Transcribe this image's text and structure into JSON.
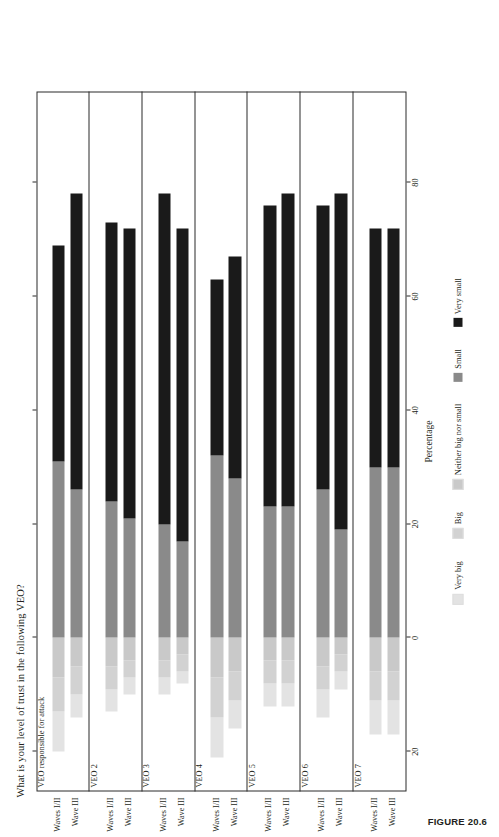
{
  "figure": {
    "caption": "FIGURE 20.6",
    "title": "What is your level of trust in the following VEO?"
  },
  "axis": {
    "label": "Percentage",
    "ticks": [
      -20,
      0,
      20,
      40,
      60,
      80
    ],
    "tick_labels": [
      "20",
      "0",
      "20",
      "40",
      "60",
      "80"
    ],
    "min": -27,
    "max": 96
  },
  "legend": {
    "items": [
      {
        "label": "Very big",
        "color": "#e3e3e3"
      },
      {
        "label": "Big",
        "color": "#d2d2d2"
      },
      {
        "label": "Neither big nor small",
        "color": "#c9c9c9"
      },
      {
        "label": "Small",
        "color": "#8a8a8a"
      },
      {
        "label": "Very small",
        "color": "#1a1a1a"
      }
    ]
  },
  "categories": [
    "Waves I/II",
    "Wave III"
  ],
  "chart_data": {
    "type": "bar",
    "subtype": "diverging-stacked-likert",
    "title": "What is your level of trust in the following VEO?",
    "xlabel": "Percentage",
    "ylabel": "",
    "xlim": [
      -27,
      96
    ],
    "grid": false,
    "legend_position": "bottom",
    "series": [
      {
        "name": "Very big",
        "color": "#e3e3e3"
      },
      {
        "name": "Big",
        "color": "#d2d2d2"
      },
      {
        "name": "Neither big nor small",
        "color": "#c9c9c9"
      },
      {
        "name": "Small",
        "color": "#8a8a8a"
      },
      {
        "name": "Very small",
        "color": "#1a1a1a"
      }
    ],
    "panels": [
      {
        "name": "VEO responsible for attack",
        "bars": [
          {
            "category": "Waves I/II",
            "start": -20.0,
            "values": {
              "Very big": 7.0,
              "Big": 6.0,
              "Neither big nor small": 7.0,
              "Small": 31.0,
              "Very small": 38.0
            },
            "total_end": 69.0
          },
          {
            "category": "Wave III",
            "start": -14.0,
            "values": {
              "Very big": 4.0,
              "Big": 5.0,
              "Neither big nor small": 5.0,
              "Small": 26.0,
              "Very small": 52.0
            },
            "total_end": 78.0
          }
        ]
      },
      {
        "name": "VEO 2",
        "bars": [
          {
            "category": "Waves I/II",
            "start": -13.0,
            "values": {
              "Very big": 4.0,
              "Big": 4.0,
              "Neither big nor small": 5.0,
              "Small": 24.0,
              "Very small": 49.0
            },
            "total_end": 73.0
          },
          {
            "category": "Wave III",
            "start": -10.0,
            "values": {
              "Very big": 3.0,
              "Big": 3.0,
              "Neither big nor small": 4.0,
              "Small": 21.0,
              "Very small": 51.0
            },
            "total_end": 72.0
          }
        ]
      },
      {
        "name": "VEO 3",
        "bars": [
          {
            "category": "Waves I/II",
            "start": -10.0,
            "values": {
              "Very big": 3.0,
              "Big": 3.0,
              "Neither big nor small": 4.0,
              "Small": 20.0,
              "Very small": 58.0
            },
            "total_end": 78.0
          },
          {
            "category": "Wave III",
            "start": -8.0,
            "values": {
              "Very big": 2.0,
              "Big": 3.0,
              "Neither big nor small": 3.0,
              "Small": 17.0,
              "Very small": 55.0
            },
            "total_end": 72.0
          }
        ]
      },
      {
        "name": "VEO 4",
        "bars": [
          {
            "category": "Waves I/II",
            "start": -21.0,
            "values": {
              "Very big": 7.0,
              "Big": 7.0,
              "Neither big nor small": 7.0,
              "Small": 32.0,
              "Very small": 31.0
            },
            "total_end": 63.0
          },
          {
            "category": "Wave III",
            "start": -16.0,
            "values": {
              "Very big": 5.0,
              "Big": 5.0,
              "Neither big nor small": 6.0,
              "Small": 28.0,
              "Very small": 39.0
            },
            "total_end": 67.0
          }
        ]
      },
      {
        "name": "VEO 5",
        "bars": [
          {
            "category": "Waves I/II",
            "start": -12.0,
            "values": {
              "Very big": 4.0,
              "Big": 4.0,
              "Neither big nor small": 4.0,
              "Small": 23.0,
              "Very small": 53.0
            },
            "total_end": 72.0
          },
          {
            "category": "Wave III",
            "start": -12.0,
            "values": {
              "Very big": 4.0,
              "Big": 4.0,
              "Neither big nor small": 4.0,
              "Small": 23.0,
              "Very small": 55.0
            },
            "total_end": 74.0
          }
        ]
      },
      {
        "name": "VEO 6",
        "bars": [
          {
            "category": "Waves I/II",
            "start": -14.0,
            "values": {
              "Very big": 5.0,
              "Big": 4.0,
              "Neither big nor small": 5.0,
              "Small": 26.0,
              "Very small": 50.0
            },
            "total_end": 71.0
          },
          {
            "category": "Wave III",
            "start": -9.0,
            "values": {
              "Very big": 3.0,
              "Big": 3.0,
              "Neither big nor small": 3.0,
              "Small": 19.0,
              "Very small": 59.0
            },
            "total_end": 76.0
          }
        ]
      },
      {
        "name": "VEO 7",
        "bars": [
          {
            "category": "Waves I/II",
            "start": -17.0,
            "values": {
              "Very big": 6.0,
              "Big": 5.0,
              "Neither big nor small": 6.0,
              "Small": 30.0,
              "Very small": 42.0
            },
            "total_end": 72.0
          },
          {
            "category": "Wave III",
            "start": -17.0,
            "values": {
              "Very big": 6.0,
              "Big": 5.0,
              "Neither big nor small": 6.0,
              "Small": 30.0,
              "Very small": 42.0
            },
            "total_end": 72.0
          }
        ]
      }
    ]
  }
}
